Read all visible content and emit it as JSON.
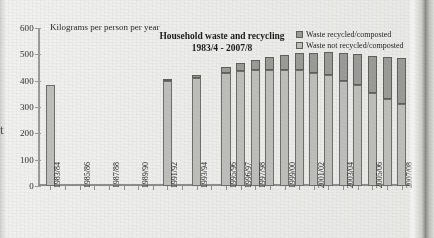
{
  "page": {
    "cut_off_char": "t"
  },
  "axis_caption": "Kilograms per person per year",
  "title": {
    "line1": "Household waste and recycling",
    "line2": "1983/4 - 2007/8"
  },
  "legend": {
    "position": "top-right",
    "items": [
      {
        "label": "Waste recycled/composted",
        "color": "#9a9a96",
        "key": "recycled"
      },
      {
        "label": "Waste not recycled/composted",
        "color": "#bdbdb9",
        "key": "not_recycled"
      }
    ]
  },
  "chart_data": {
    "type": "bar",
    "stacked": true,
    "title": "Household waste and recycling 1983/4 - 2007/8",
    "xlabel": "",
    "ylabel": "Kilograms per person per year",
    "ylim": [
      0,
      600
    ],
    "yticks": [
      0,
      100,
      200,
      300,
      400,
      500,
      600
    ],
    "grid": false,
    "categories": [
      "1983/84",
      "1984/85",
      "1985/86",
      "1986/87",
      "1987/88",
      "1988/89",
      "1989/90",
      "1990/91",
      "1991/92",
      "1992/93",
      "1993/94",
      "1994/95",
      "1995/96",
      "1996/97",
      "1997/98",
      "1998/99",
      "1999/00",
      "2000/01",
      "2001/02",
      "2002/03",
      "2003/04",
      "2004/05",
      "2005/06",
      "2006/07",
      "2007/08"
    ],
    "tick_labels": [
      "1983/84",
      "",
      "1985/86",
      "",
      "1987/88",
      "",
      "1989/90",
      "",
      "1991/92",
      "",
      "1993/94",
      "",
      "1995/96",
      "1996/97",
      "1997/98",
      "",
      "1999/00",
      "",
      "2001/02",
      "",
      "2003/04",
      "",
      "2005/06",
      "",
      "2007/08"
    ],
    "series": [
      {
        "name": "Waste not recycled/composted",
        "color": "#bdbdb9",
        "values": [
          385,
          null,
          null,
          null,
          null,
          null,
          null,
          null,
          397,
          null,
          410,
          null,
          428,
          438,
          440,
          441,
          439,
          440,
          430,
          420,
          400,
          382,
          355,
          330,
          310
        ]
      },
      {
        "name": "Waste recycled/composted",
        "color": "#9a9a96",
        "values": [
          0,
          null,
          null,
          null,
          null,
          null,
          null,
          null,
          8,
          null,
          12,
          null,
          25,
          30,
          40,
          48,
          57,
          65,
          75,
          88,
          105,
          120,
          140,
          160,
          175
        ]
      }
    ],
    "totals": [
      385,
      null,
      null,
      null,
      null,
      null,
      null,
      null,
      405,
      null,
      422,
      null,
      453,
      468,
      480,
      489,
      496,
      505,
      505,
      508,
      505,
      502,
      495,
      490,
      485
    ],
    "missing_years": [
      "1984/85",
      "1985/86",
      "1986/87",
      "1987/88",
      "1988/89",
      "1989/90",
      "1990/91",
      "1992/93",
      "1994/95"
    ]
  }
}
